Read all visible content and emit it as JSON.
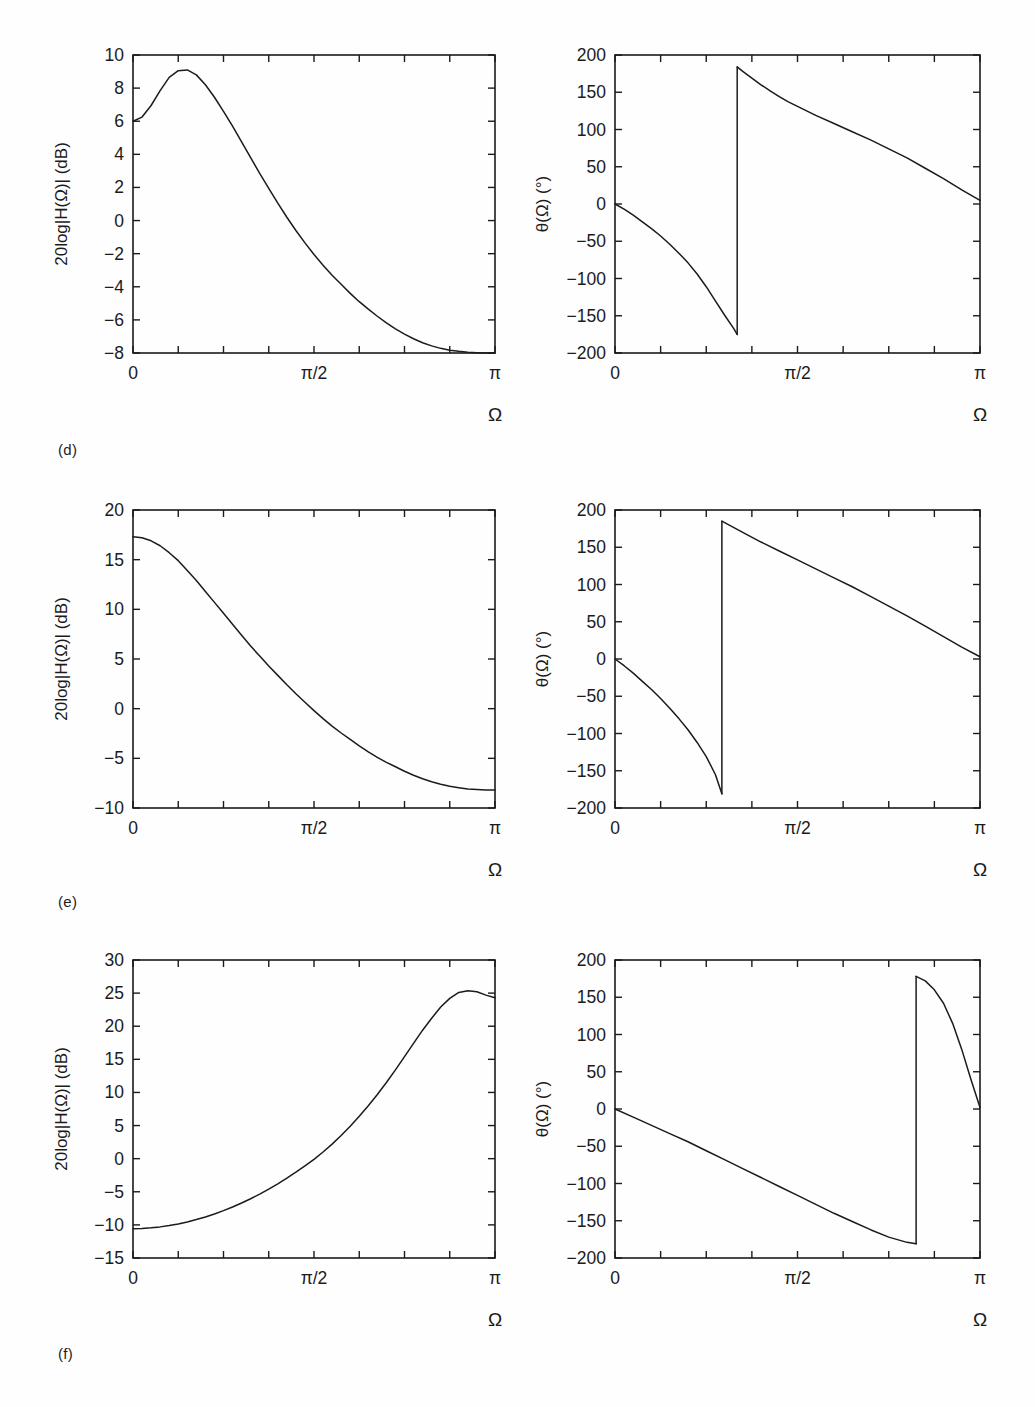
{
  "page": {
    "background": "#fefefe",
    "ink": "#1b1b1b",
    "panel_labels": [
      {
        "id": "d",
        "text": "(d)"
      },
      {
        "id": "e",
        "text": "(e)"
      },
      {
        "id": "f",
        "text": "(f)"
      }
    ]
  },
  "axis_titles": {
    "magnitude_y": "20log|H(Ω)| (dB)",
    "phase_y": "θ(Ω) (°)",
    "x": "Ω"
  },
  "x_ticks": {
    "labels": [
      "0",
      "π/2",
      "π"
    ],
    "values": [
      0,
      1.5707963,
      3.1415927
    ]
  },
  "chart_data": [
    {
      "id": "d-magnitude",
      "type": "line",
      "panel": "(d)",
      "title": "",
      "xlabel": "Ω",
      "ylabel": "20log|H(Ω)| (dB)",
      "xlim": [
        0,
        3.1415927
      ],
      "ylim": [
        -8,
        10
      ],
      "xtick_labels": [
        "0",
        "π/2",
        "π"
      ],
      "xtick_values": [
        0,
        1.5707963,
        3.1415927
      ],
      "ytick_labels": [
        "-8",
        "-6",
        "-4",
        "-2",
        "0",
        "2",
        "4",
        "6",
        "8",
        "10"
      ],
      "ytick_values": [
        -8,
        -6,
        -4,
        -2,
        0,
        2,
        4,
        6,
        8,
        10
      ],
      "grid": false,
      "legend": "none",
      "annotations": [
        "peak ≈ 9.1 dB near Ω ≈ 0.23π",
        "starts at 6.0 dB at Ω = 0",
        "ends at -8 dB at Ω = π"
      ],
      "x": [
        0.0,
        0.0785,
        0.1571,
        0.2356,
        0.3142,
        0.3927,
        0.4712,
        0.5498,
        0.6283,
        0.7069,
        0.7854,
        0.8639,
        0.9425,
        1.021,
        1.0996,
        1.1781,
        1.2566,
        1.3352,
        1.4137,
        1.4923,
        1.5708,
        1.6493,
        1.7279,
        1.8064,
        1.885,
        1.9635,
        2.042,
        2.1206,
        2.1991,
        2.2777,
        2.3562,
        2.4347,
        2.5133,
        2.5918,
        2.6704,
        2.7489,
        2.8274,
        2.906,
        2.9845,
        3.0631,
        3.1416
      ],
      "y": [
        6.0,
        6.25,
        6.95,
        7.85,
        8.65,
        9.05,
        9.1,
        8.8,
        8.2,
        7.45,
        6.6,
        5.7,
        4.75,
        3.8,
        2.85,
        1.95,
        1.05,
        0.2,
        -0.6,
        -1.35,
        -2.05,
        -2.7,
        -3.3,
        -3.85,
        -4.4,
        -4.9,
        -5.35,
        -5.78,
        -6.18,
        -6.54,
        -6.86,
        -7.14,
        -7.38,
        -7.57,
        -7.72,
        -7.83,
        -7.9,
        -7.95,
        -7.98,
        -8.0,
        -8.0
      ]
    },
    {
      "id": "d-phase",
      "type": "line",
      "panel": "(d)",
      "title": "",
      "xlabel": "Ω",
      "ylabel": "θ(Ω) (°)",
      "xlim": [
        0,
        3.1415927
      ],
      "ylim": [
        -200,
        200
      ],
      "xtick_labels": [
        "0",
        "π/2",
        "π"
      ],
      "xtick_values": [
        0,
        1.5707963,
        3.1415927
      ],
      "ytick_labels": [
        "-200",
        "-150",
        "-100",
        "-50",
        "0",
        "50",
        "100",
        "150",
        "200"
      ],
      "ytick_values": [
        -200,
        -150,
        -100,
        -50,
        0,
        50,
        100,
        150,
        200
      ],
      "grid": false,
      "legend": "none",
      "annotations": [
        "phase wraps at Ω ≈ 0.335π from -175° to +184°",
        "ends near +5° at Ω = π"
      ],
      "segments": [
        {
          "x": [
            0.0,
            0.0785,
            0.1571,
            0.2356,
            0.3142,
            0.3927,
            0.4712,
            0.5498,
            0.6283,
            0.7069,
            0.7854,
            0.8639,
            0.9425,
            1.021,
            1.0517
          ],
          "y": [
            0.0,
            -7.0,
            -15.0,
            -24.0,
            -33.0,
            -43.0,
            -54.0,
            -66.0,
            -79.0,
            -94.0,
            -111.0,
            -130.0,
            -149.0,
            -167.0,
            -175.0
          ]
        },
        {
          "x": [
            1.0517,
            1.0996,
            1.1781,
            1.2566,
            1.3352,
            1.4137,
            1.4923,
            1.5708,
            1.7279,
            1.885,
            2.042,
            2.1991,
            2.3562,
            2.5133,
            2.6704,
            2.8274,
            2.9845,
            3.1416
          ],
          "y": [
            184.0,
            178.0,
            169.0,
            160.0,
            152.0,
            144.0,
            137.0,
            131.0,
            119.0,
            108.0,
            97.0,
            86.0,
            74.0,
            62.0,
            48.0,
            34.0,
            19.0,
            5.0
          ]
        }
      ]
    },
    {
      "id": "e-magnitude",
      "type": "line",
      "panel": "(e)",
      "title": "",
      "xlabel": "Ω",
      "ylabel": "20log|H(Ω)| (dB)",
      "xlim": [
        0,
        3.1415927
      ],
      "ylim": [
        -10,
        20
      ],
      "xtick_labels": [
        "0",
        "π/2",
        "π"
      ],
      "xtick_values": [
        0,
        1.5707963,
        3.1415927
      ],
      "ytick_labels": [
        "-10",
        "-5",
        "0",
        "5",
        "10",
        "15",
        "20"
      ],
      "ytick_values": [
        -10,
        -5,
        0,
        5,
        10,
        15,
        20
      ],
      "grid": false,
      "legend": "none",
      "annotations": [
        "monotone lowpass from 17.3 dB at Ω = 0 to -8.2 dB at Ω = π"
      ],
      "x": [
        0.0,
        0.0785,
        0.1571,
        0.2356,
        0.3142,
        0.3927,
        0.4712,
        0.5498,
        0.6283,
        0.7069,
        0.7854,
        0.8639,
        0.9425,
        1.021,
        1.0996,
        1.1781,
        1.2566,
        1.3352,
        1.4137,
        1.4923,
        1.5708,
        1.6493,
        1.7279,
        1.8064,
        1.885,
        1.9635,
        2.042,
        2.1206,
        2.1991,
        2.2777,
        2.3562,
        2.4347,
        2.5133,
        2.5918,
        2.6704,
        2.7489,
        2.8274,
        2.906,
        2.9845,
        3.0631,
        3.1416
      ],
      "y": [
        17.3,
        17.2,
        16.9,
        16.4,
        15.7,
        14.9,
        13.9,
        12.9,
        11.8,
        10.7,
        9.6,
        8.5,
        7.4,
        6.3,
        5.3,
        4.3,
        3.35,
        2.4,
        1.5,
        0.65,
        -0.2,
        -1.0,
        -1.75,
        -2.45,
        -3.1,
        -3.75,
        -4.35,
        -4.9,
        -5.4,
        -5.85,
        -6.3,
        -6.7,
        -7.05,
        -7.35,
        -7.6,
        -7.8,
        -7.95,
        -8.08,
        -8.15,
        -8.2,
        -8.2
      ]
    },
    {
      "id": "e-phase",
      "type": "line",
      "panel": "(e)",
      "title": "",
      "xlabel": "Ω",
      "ylabel": "θ(Ω) (°)",
      "xlim": [
        0,
        3.1415927
      ],
      "ylim": [
        -200,
        200
      ],
      "xtick_labels": [
        "0",
        "π/2",
        "π"
      ],
      "xtick_values": [
        0,
        1.5707963,
        3.1415927
      ],
      "ytick_labels": [
        "-200",
        "-150",
        "-100",
        "-50",
        "0",
        "50",
        "100",
        "150",
        "200"
      ],
      "ytick_values": [
        -200,
        -150,
        -100,
        -50,
        0,
        50,
        100,
        150,
        200
      ],
      "grid": false,
      "legend": "none",
      "annotations": [
        "phase wraps at Ω ≈ 0.29π from -181° to +185°",
        "ends near +3° at Ω = π"
      ],
      "segments": [
        {
          "x": [
            0.0,
            0.0785,
            0.1571,
            0.2356,
            0.3142,
            0.3927,
            0.4712,
            0.5498,
            0.6283,
            0.7069,
            0.7854,
            0.8639,
            0.9199
          ],
          "y": [
            0.0,
            -9.0,
            -19.0,
            -30.0,
            -41.0,
            -53.0,
            -66.0,
            -80.0,
            -95.0,
            -112.0,
            -131.0,
            -155.0,
            -181.0
          ]
        },
        {
          "x": [
            0.9199,
            1.0996,
            1.2566,
            1.4137,
            1.5708,
            1.7279,
            1.885,
            2.042,
            2.1991,
            2.3562,
            2.5133,
            2.6704,
            2.8274,
            2.9845,
            3.1416
          ],
          "y": [
            185.0,
            170.0,
            157.0,
            145.0,
            133.0,
            121.0,
            109.0,
            97.0,
            84.0,
            71.0,
            58.0,
            44.0,
            30.0,
            16.0,
            3.0
          ]
        }
      ]
    },
    {
      "id": "f-magnitude",
      "type": "line",
      "panel": "(f)",
      "title": "",
      "xlabel": "Ω",
      "ylabel": "20log|H(Ω)| (dB)",
      "xlim": [
        0,
        3.1415927
      ],
      "ylim": [
        -15,
        30
      ],
      "xtick_labels": [
        "0",
        "π/2",
        "π"
      ],
      "xtick_values": [
        0,
        1.5707963,
        3.1415927
      ],
      "ytick_labels": [
        "-15",
        "-10",
        "-5",
        "0",
        "5",
        "10",
        "15",
        "20",
        "25",
        "30"
      ],
      "ytick_values": [
        -15,
        -10,
        -5,
        0,
        5,
        10,
        15,
        20,
        25,
        30
      ],
      "grid": false,
      "legend": "none",
      "annotations": [
        "highpass rising from -10.6 dB at Ω = 0",
        "peak ≈ 25.3 dB near Ω ≈ 0.9π",
        "ends at 24.3 dB at Ω = π"
      ],
      "x": [
        0.0,
        0.0785,
        0.1571,
        0.2356,
        0.3142,
        0.3927,
        0.4712,
        0.5498,
        0.6283,
        0.7069,
        0.7854,
        0.8639,
        0.9425,
        1.021,
        1.0996,
        1.1781,
        1.2566,
        1.3352,
        1.4137,
        1.4923,
        1.5708,
        1.6493,
        1.7279,
        1.8064,
        1.885,
        1.9635,
        2.042,
        2.1206,
        2.1991,
        2.2777,
        2.3562,
        2.4347,
        2.5133,
        2.5918,
        2.6704,
        2.7489,
        2.8274,
        2.906,
        2.9845,
        3.0631,
        3.1416
      ],
      "y": [
        -10.6,
        -10.55,
        -10.45,
        -10.3,
        -10.1,
        -9.85,
        -9.55,
        -9.2,
        -8.8,
        -8.35,
        -7.85,
        -7.3,
        -6.7,
        -6.05,
        -5.35,
        -4.6,
        -3.8,
        -2.95,
        -2.05,
        -1.1,
        -0.1,
        1.0,
        2.2,
        3.5,
        4.9,
        6.4,
        8.0,
        9.7,
        11.5,
        13.4,
        15.4,
        17.4,
        19.4,
        21.2,
        22.9,
        24.2,
        25.1,
        25.35,
        25.2,
        24.7,
        24.3
      ]
    },
    {
      "id": "f-phase",
      "type": "line",
      "panel": "(f)",
      "title": "",
      "xlabel": "Ω",
      "ylabel": "θ(Ω) (°)",
      "xlim": [
        0,
        3.1415927
      ],
      "ylim": [
        -200,
        200
      ],
      "xtick_labels": [
        "0",
        "π/2",
        "π"
      ],
      "xtick_values": [
        0,
        1.5707963,
        3.1415927
      ],
      "ytick_labels": [
        "-200",
        "-150",
        "-100",
        "-50",
        "0",
        "50",
        "100",
        "150",
        "200"
      ],
      "ytick_values": [
        -200,
        -150,
        -100,
        -50,
        0,
        50,
        100,
        150,
        200
      ],
      "grid": false,
      "legend": "none",
      "annotations": [
        "near-linear decrease to -181°",
        "phase wraps at Ω ≈ 0.825π to +178°",
        "ends near 0° at Ω = π"
      ],
      "segments": [
        {
          "x": [
            0.0,
            0.1571,
            0.3142,
            0.4712,
            0.6283,
            0.7854,
            0.9425,
            1.0996,
            1.2566,
            1.4137,
            1.5708,
            1.7279,
            1.885,
            2.042,
            2.1991,
            2.3562,
            2.5133,
            2.5918
          ],
          "y": [
            0.0,
            -11.0,
            -22.0,
            -33.0,
            -44.0,
            -56.0,
            -68.0,
            -80.0,
            -92.0,
            -104.0,
            -116.0,
            -128.0,
            -140.0,
            -151.0,
            -162.0,
            -172.0,
            -179.0,
            -181.0
          ]
        },
        {
          "x": [
            2.5918,
            2.6704,
            2.7489,
            2.8274,
            2.906,
            2.9845,
            3.0631,
            3.1416
          ],
          "y": [
            178.0,
            172.0,
            160.0,
            142.0,
            115.0,
            80.0,
            40.0,
            2.0
          ]
        }
      ]
    }
  ]
}
